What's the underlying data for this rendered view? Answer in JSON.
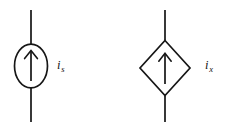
{
  "figure": {
    "background_color": "#ffffff",
    "line_color": "#161616",
    "width": 234,
    "height": 134
  },
  "symbols": [
    {
      "id": "independent-current-source",
      "kind": "independent",
      "shape": "circle",
      "arrow_direction": "up",
      "label_variable": "i",
      "label_subscript": "s",
      "label_text": "is",
      "center_x": 31,
      "center_y": 66,
      "radius_x": 17,
      "radius_y": 22,
      "wire_top_y": 10,
      "wire_bottom_y": 122
    },
    {
      "id": "dependent-current-source",
      "kind": "dependent",
      "shape": "diamond",
      "arrow_direction": "up",
      "label_variable": "i",
      "label_subscript": "x",
      "label_text": "ix",
      "center_x": 165,
      "center_y": 68,
      "half_width": 25,
      "half_height": 28,
      "wire_top_y": 10,
      "wire_bottom_y": 122
    }
  ],
  "labels": {
    "is": {
      "variable": "i",
      "subscript": "s"
    },
    "ix": {
      "variable": "i",
      "subscript": "x"
    }
  }
}
